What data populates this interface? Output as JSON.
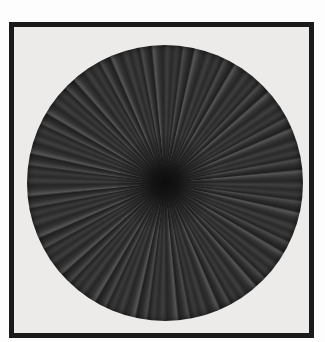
{
  "image": {
    "subject": "framed radial starburst artwork",
    "colors": {
      "frame": "#1a1a1a",
      "mat": "#ecebea",
      "disc": "#2a2a2a",
      "center": "#0d0d0d"
    }
  }
}
